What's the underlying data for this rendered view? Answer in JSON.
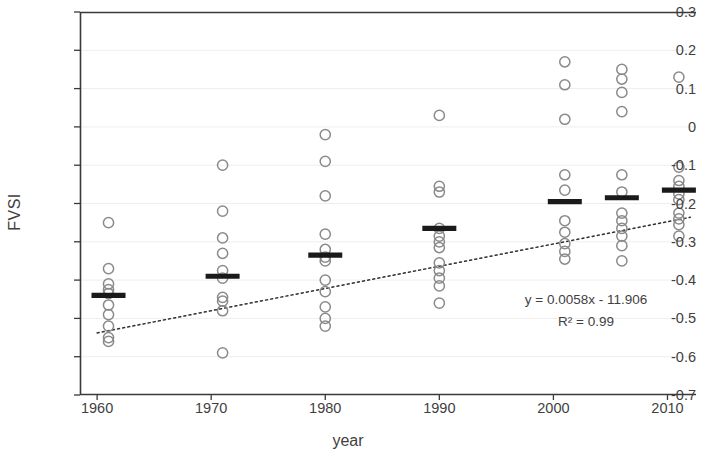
{
  "chart_data": {
    "type": "scatter",
    "title": "",
    "xlabel": "year",
    "ylabel": "FVSI",
    "xlim": [
      1958.5,
      2012.5
    ],
    "ylim": [
      -0.7,
      0.3
    ],
    "grid": true,
    "grid_orientation": "horizontal",
    "legend": "none",
    "xticks": [
      1960,
      1970,
      1980,
      1990,
      2000,
      2010
    ],
    "xtick_labels": [
      "1960",
      "1970",
      "1980",
      "1990",
      "2000",
      "2010"
    ],
    "yticks": [
      0.3,
      0.2,
      0.1,
      0,
      -0.1,
      -0.2,
      -0.3,
      -0.4,
      -0.5,
      -0.6,
      -0.7
    ],
    "ytick_labels": [
      "0.3",
      "0.2",
      "0.1",
      "0",
      "-0.1",
      "-0.2",
      "-0.3",
      "-0.4",
      "-0.5",
      "-0.6",
      "-0.7"
    ],
    "marker": "open-circle",
    "marker_color": "#8a8a8a",
    "groups": [
      {
        "x": 1961,
        "mean": -0.44,
        "values": [
          -0.25,
          -0.37,
          -0.41,
          -0.425,
          -0.435,
          -0.465,
          -0.49,
          -0.52,
          -0.55,
          -0.56
        ]
      },
      {
        "x": 1971,
        "mean": -0.39,
        "values": [
          -0.1,
          -0.22,
          -0.29,
          -0.33,
          -0.375,
          -0.395,
          -0.445,
          -0.455,
          -0.48,
          -0.59
        ]
      },
      {
        "x": 1980,
        "mean": -0.335,
        "values": [
          -0.02,
          -0.09,
          -0.18,
          -0.28,
          -0.32,
          -0.34,
          -0.35,
          -0.4,
          -0.43,
          -0.47,
          -0.5,
          -0.52
        ]
      },
      {
        "x": 1990,
        "mean": -0.265,
        "values": [
          0.03,
          -0.155,
          -0.17,
          -0.265,
          -0.285,
          -0.3,
          -0.315,
          -0.355,
          -0.375,
          -0.395,
          -0.415,
          -0.46
        ]
      },
      {
        "x": 2001,
        "mean": -0.195,
        "values": [
          0.17,
          0.11,
          0.02,
          -0.125,
          -0.165,
          -0.245,
          -0.275,
          -0.305,
          -0.325,
          -0.345
        ]
      },
      {
        "x": 2006,
        "mean": -0.185,
        "values": [
          0.15,
          0.125,
          0.09,
          0.04,
          -0.125,
          -0.17,
          -0.225,
          -0.245,
          -0.265,
          -0.285,
          -0.31,
          -0.35
        ]
      },
      {
        "x": 2011,
        "mean": -0.165,
        "values": [
          0.13,
          -0.105,
          -0.14,
          -0.155,
          -0.175,
          -0.19,
          -0.225,
          -0.24,
          -0.255,
          -0.285
        ]
      }
    ],
    "trendline": {
      "style": "dotted",
      "color": "#2f2f2f",
      "slope": 0.0058,
      "intercept": -11.906,
      "x_start": 1960,
      "x_end": 2012,
      "y_start": -0.538,
      "y_end": -0.236
    },
    "annotations": {
      "equation": "y = 0.0058x - 11.906",
      "r_squared": "R² = 0.99"
    },
    "mean_marker": {
      "style": "horizontal-bar",
      "color": "#1a1a1a"
    }
  }
}
